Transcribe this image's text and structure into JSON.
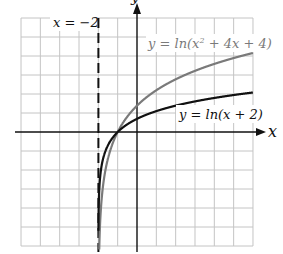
{
  "chart_data": {
    "type": "line",
    "title": "",
    "xlabel": "x",
    "ylabel": "y",
    "xlim": [
      -6,
      6
    ],
    "ylim": [
      -6,
      6
    ],
    "grid": true,
    "grid_step": 1,
    "legend_position": "inline labels",
    "series": [
      {
        "name": "y = ln(x² + 4x + 4)",
        "expression": "ln(x^2 + 4x + 4)",
        "color": "#7a7a7a",
        "x": [
          -1.9,
          -1.5,
          -1,
          0,
          1,
          2,
          3,
          4,
          5,
          6
        ],
        "y": [
          -4.61,
          -1.39,
          0,
          1.39,
          2.2,
          2.77,
          3.22,
          3.58,
          3.89,
          4.16
        ]
      },
      {
        "name": "y = ln(x + 2)",
        "expression": "ln(x + 2)",
        "color": "#111111",
        "x": [
          -1.9,
          -1.5,
          -1,
          0,
          1,
          2,
          3,
          4,
          5,
          6
        ],
        "y": [
          -2.3,
          -0.69,
          0,
          0.69,
          1.1,
          1.39,
          1.61,
          1.79,
          1.95,
          2.08
        ]
      }
    ],
    "annotations": [
      {
        "text": "x = −2",
        "type": "vertical asymptote (dashed)",
        "x": -2
      }
    ]
  },
  "labels": {
    "asymptote": "x = −2",
    "curve_gray_prefix": "y = ln(x",
    "curve_gray_sup": "2",
    "curve_gray_suffix": " + 4x + 4)",
    "curve_black": "y = ln(x + 2)",
    "x_axis": "x",
    "y_axis": "y"
  },
  "colors": {
    "grid": "#c4c4c4",
    "axis": "#111111",
    "curve_gray": "#7a7a7a",
    "curve_black": "#111111"
  }
}
